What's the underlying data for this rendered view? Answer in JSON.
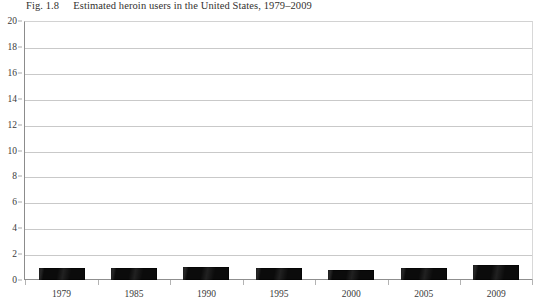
{
  "figure": {
    "label": "Fig. 1.8",
    "caption": "Estimated heroin users in the United States, 1979–2009"
  },
  "colors": {
    "bar": "#0b0b0b",
    "gridline": "#c9c9c9",
    "axis": "#8c8c8c",
    "text": "#33312f",
    "background": "#ffffff"
  },
  "chart_data": {
    "type": "bar",
    "title": "Estimated heroin users in the United States, 1979–2009",
    "subtitle": "",
    "xlabel": "",
    "ylabel": "",
    "categories": [
      "1979",
      "1985",
      "1990",
      "1995",
      "2000",
      "2005",
      "2009"
    ],
    "values": [
      0.95,
      0.9,
      1.0,
      0.9,
      0.75,
      0.95,
      1.15
    ],
    "ylim": [
      0,
      20
    ],
    "ytick_labels": [
      "0",
      "2",
      "4",
      "6",
      "8",
      "10",
      "12",
      "14",
      "16",
      "18",
      "20"
    ],
    "ytick_values": [
      0,
      2,
      4,
      6,
      8,
      10,
      12,
      14,
      16,
      18,
      20
    ],
    "grid": true,
    "legend": false,
    "legend_position": "none",
    "series": [
      {
        "name": "Estimated heroin users",
        "values": [
          0.95,
          0.9,
          1.0,
          0.9,
          0.75,
          0.95,
          1.15
        ]
      }
    ]
  }
}
